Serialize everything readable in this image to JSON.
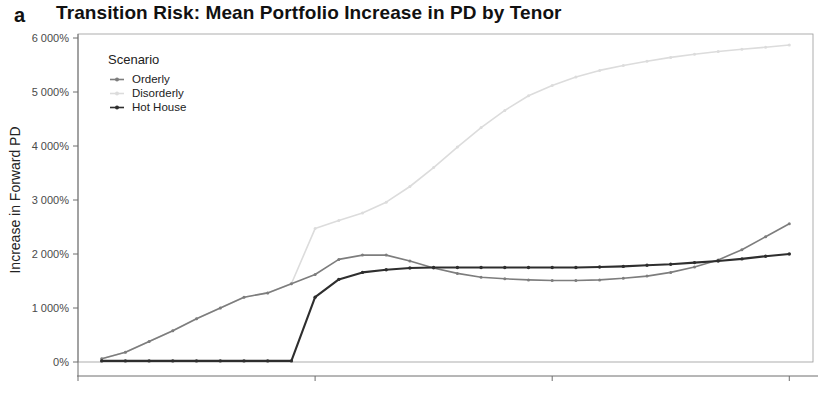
{
  "panel": {
    "label": "a"
  },
  "header": {
    "title": "Transition Risk: Mean Portfolio Increase in PD by Tenor"
  },
  "legend": {
    "title": "Scenario",
    "position": "top-left-inside",
    "entries": [
      {
        "label": "Orderly",
        "color": "#7d7d7d",
        "marker": "point-dash"
      },
      {
        "label": "Disorderly",
        "color": "#dcdcdc",
        "marker": "point-dash"
      },
      {
        "label": "Hot House",
        "color": "#2e2e2e",
        "marker": "point-dash"
      }
    ]
  },
  "axes": {
    "x": {
      "label": "Tenor",
      "ticks": [
        "0",
        "10",
        "20",
        "30"
      ],
      "tick_values": [
        0,
        10,
        20,
        30
      ],
      "min": 0,
      "max": 31
    },
    "y": {
      "label": "Increase in Forward PD",
      "ticks": [
        "0%",
        "1 000%",
        "2 000%",
        "3 000%",
        "4 000%",
        "5 000%",
        "6 000%"
      ],
      "tick_values": [
        0,
        1000,
        2000,
        3000,
        4000,
        5000,
        6000
      ],
      "min": 0,
      "max": 6200
    }
  },
  "chart_data": {
    "type": "line",
    "title": "Transition Risk: Mean Portfolio Increase in PD by Tenor",
    "xlabel": "Tenor",
    "ylabel": "Increase in Forward PD",
    "xlim": [
      0,
      31
    ],
    "ylim": [
      0,
      6200
    ],
    "grid": false,
    "legend_title": "Scenario",
    "legend_position": "top-left-inside",
    "units": "percent",
    "x": [
      1,
      2,
      3,
      4,
      5,
      6,
      7,
      8,
      9,
      10,
      11,
      12,
      13,
      14,
      15,
      16,
      17,
      18,
      19,
      20,
      21,
      22,
      23,
      24,
      25,
      26,
      27,
      28,
      29,
      30
    ],
    "series": [
      {
        "name": "Orderly",
        "color": "#7d7d7d",
        "values": [
          60,
          180,
          380,
          580,
          800,
          1000,
          1200,
          1280,
          1450,
          1620,
          1900,
          1980,
          1980,
          1870,
          1740,
          1640,
          1570,
          1540,
          1520,
          1510,
          1510,
          1520,
          1550,
          1590,
          1660,
          1760,
          1890,
          2080,
          2320,
          2560
        ]
      },
      {
        "name": "Disorderly",
        "color": "#dcdcdc",
        "values": [
          60,
          180,
          380,
          580,
          800,
          1000,
          1200,
          1280,
          1450,
          2470,
          2620,
          2760,
          2960,
          3250,
          3600,
          3980,
          4340,
          4660,
          4930,
          5120,
          5280,
          5400,
          5490,
          5570,
          5640,
          5700,
          5750,
          5790,
          5830,
          5870
        ]
      },
      {
        "name": "Hot House",
        "color": "#2e2e2e",
        "values": [
          20,
          20,
          20,
          20,
          20,
          20,
          20,
          20,
          20,
          1200,
          1530,
          1660,
          1710,
          1740,
          1750,
          1750,
          1750,
          1750,
          1750,
          1750,
          1750,
          1760,
          1770,
          1790,
          1810,
          1840,
          1870,
          1910,
          1960,
          2000
        ]
      }
    ]
  }
}
